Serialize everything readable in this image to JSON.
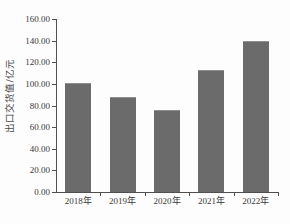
{
  "chart_data": {
    "type": "bar",
    "title": "",
    "subtitle": "",
    "xlabel": "",
    "ylabel": "出口交货值/亿元",
    "categories": [
      "2018年",
      "2019年",
      "2020年",
      "2021年",
      "2022年"
    ],
    "values": [
      101.0,
      88.0,
      76.0,
      113.0,
      140.0
    ],
    "series": [
      {
        "name": "出口交货值",
        "values": [
          101.0,
          88.0,
          76.0,
          113.0,
          140.0
        ]
      }
    ],
    "ylim": [
      0,
      160
    ],
    "ytick_step": 20,
    "ytick_labels": [
      "0.00",
      "20.00",
      "40.00",
      "60.00",
      "80.00",
      "100.00",
      "120.00",
      "140.00",
      "160.00"
    ],
    "ytick_values": [
      0,
      20,
      40,
      60,
      80,
      100,
      120,
      140,
      160
    ],
    "grid": false,
    "legend": false,
    "legend_position": "none",
    "bar_color": "#6b6b6b",
    "axis_color": "#4f4f4f",
    "background_color": "#fdfdfd",
    "annotations": []
  }
}
